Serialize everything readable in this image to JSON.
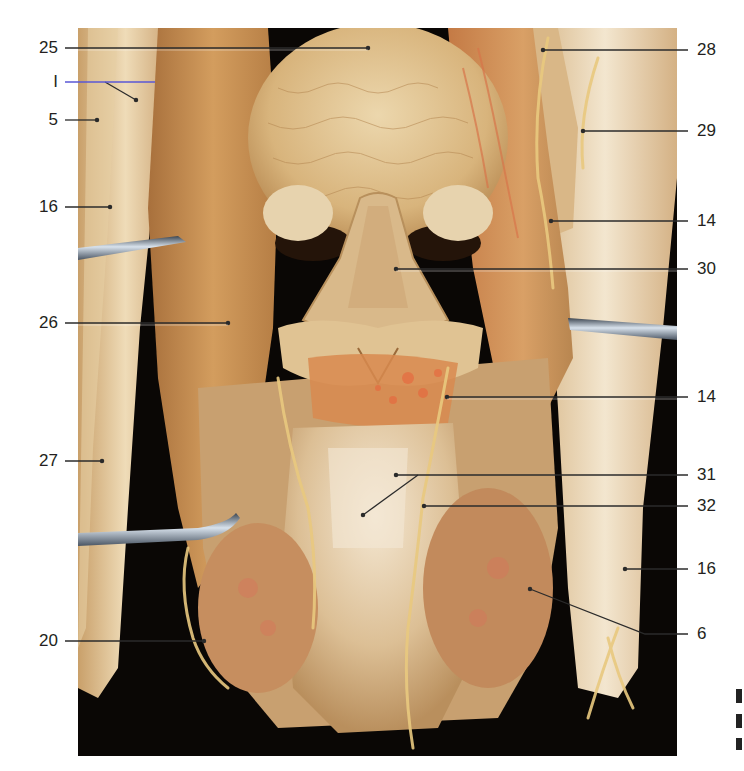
{
  "figure": {
    "colors": {
      "background": "#ffffff",
      "photo_backdrop": "#0a0705",
      "tissue_light": "#e9d2a6",
      "tissue_mid": "#c99c63",
      "tissue_dark": "#9a6a3a",
      "muscle": "#c78a4c",
      "vessel_red": "#d8754a",
      "retractor_metal": "#9fb0c4",
      "label_text": "#231f20",
      "leader_line": "#2b2b2b",
      "highlight_line": "#5a57d6"
    }
  },
  "labels_left": [
    {
      "id": "25",
      "text": "25",
      "y": 48
    },
    {
      "id": "1",
      "text": "I",
      "y": 82
    },
    {
      "id": "5",
      "text": "5",
      "y": 120
    },
    {
      "id": "16a",
      "text": "16",
      "y": 207
    },
    {
      "id": "26",
      "text": "26",
      "y": 323
    },
    {
      "id": "27",
      "text": "27",
      "y": 461
    },
    {
      "id": "20",
      "text": "20",
      "y": 641
    }
  ],
  "labels_right": [
    {
      "id": "28",
      "text": "28",
      "y": 50
    },
    {
      "id": "29",
      "text": "29",
      "y": 131
    },
    {
      "id": "14a",
      "text": "14",
      "y": 221
    },
    {
      "id": "30",
      "text": "30",
      "y": 269
    },
    {
      "id": "14b",
      "text": "14",
      "y": 397
    },
    {
      "id": "31",
      "text": "31",
      "y": 475
    },
    {
      "id": "32",
      "text": "32",
      "y": 506
    },
    {
      "id": "16b",
      "text": "16",
      "y": 569
    },
    {
      "id": "6",
      "text": "6",
      "y": 634
    }
  ]
}
